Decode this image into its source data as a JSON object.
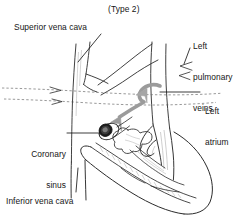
{
  "figure": {
    "title": "(Type 2)",
    "colors": {
      "ink": "#1a1a1a",
      "outline": "#2b2b2b",
      "hatch": "#8d8d8d",
      "dashed": "#555555",
      "flow_arrow": "#9a9a9a",
      "ostium_dark": "#1b1b1b",
      "background": "#ffffff"
    },
    "labels": [
      {
        "id": "superior-vena-cava",
        "text": "Superior vena cava",
        "lines": [
          "Superior vena cava"
        ],
        "x": 14,
        "y": 22,
        "leader": "diagonal-down-right"
      },
      {
        "id": "left-pulmonary-veins",
        "text": "Left pulmonary veins",
        "lines": [
          "Left",
          "pulmonary",
          "veins"
        ],
        "x": 193,
        "y": 20,
        "leader": "vertical-down"
      },
      {
        "id": "left-atrium",
        "text": "Left atrium",
        "lines": [
          "Left",
          "atrium"
        ],
        "x": 205,
        "y": 85,
        "leader": "horizontal-left"
      },
      {
        "id": "coronary-sinus",
        "text": "Coronary sinus",
        "lines": [
          "Coronary",
          "sinus"
        ],
        "x": 18,
        "y": 128,
        "leader": "horizontal-right"
      },
      {
        "id": "inferior-vena-cava",
        "text": "Inferior vena cava",
        "lines": [
          "Inferior vena cava"
        ],
        "x": 6,
        "y": 196,
        "leader": "vertical-up"
      }
    ],
    "annotations": {
      "flow_arrow_description": "gray curved arrow from pulmonary veins into coronary sinus ostium",
      "dashed_lines": 2,
      "flow_marks_svc": 2,
      "flow_marks_pv": 2
    }
  }
}
